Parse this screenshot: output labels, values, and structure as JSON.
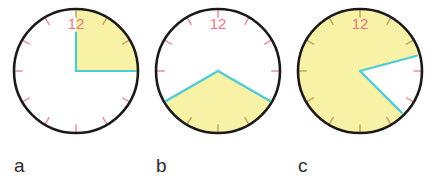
{
  "figure": {
    "title": "",
    "canvas": {
      "width": 435,
      "height": 182,
      "background": "#ffffff"
    },
    "style": {
      "sector_fill": "#f7f2a6",
      "rim_color": "#1a1a1a",
      "rim_width": 2.6,
      "tick_color": "#e98f9c",
      "tick_color_on_yellow": "#c9a06a",
      "hand_color": "#4ec9da",
      "hand_width": 2.2,
      "number_color": "#ef7486",
      "label_color": "#2b2b2b"
    },
    "geometry": {
      "radius": 62,
      "center_y": 71,
      "tick_count": 12,
      "tick_inner_fraction": 0.86
    },
    "clocks": [
      {
        "id": "clock-a",
        "label": "a",
        "label_x": 14,
        "label_y": 172,
        "center_x": 76,
        "hour_number": "12",
        "number_x": 76,
        "number_y": 29,
        "sector_start_deg": 0,
        "sector_sweep_deg": 90,
        "sector_description": "quarter turn clockwise from 12 to 3",
        "hands": [
          {
            "name": "hand-start",
            "angle_deg": 0,
            "length_fraction": 0.62
          },
          {
            "name": "hand-end",
            "angle_deg": 90,
            "length_fraction": 0.95
          }
        ]
      },
      {
        "id": "clock-b",
        "label": "b",
        "label_x": 156,
        "label_y": 172,
        "center_x": 218,
        "hour_number": "12",
        "number_x": 218,
        "number_y": 29,
        "sector_start_deg": 120,
        "sector_sweep_deg": 120,
        "sector_description": "sector across the bottom from 4 to 8 o'clock",
        "hands": [
          {
            "name": "hand-start",
            "angle_deg": 120,
            "length_fraction": 0.97
          },
          {
            "name": "hand-end",
            "angle_deg": 240,
            "length_fraction": 0.97
          }
        ]
      },
      {
        "id": "clock-c",
        "label": "c",
        "label_x": 298,
        "label_y": 172,
        "center_x": 360,
        "hour_number": "12",
        "number_x": 360,
        "number_y": 29,
        "sector_start_deg": 135,
        "sector_sweep_deg": 300,
        "sector_description": "five-sixths turn; white wedge remains between 1:30 and 4:30",
        "hands": [
          {
            "name": "hand-start",
            "angle_deg": 135,
            "length_fraction": 0.95
          },
          {
            "name": "hand-end",
            "angle_deg": 75,
            "length_fraction": 0.95
          }
        ]
      }
    ]
  },
  "chart_data": {
    "type": "pie",
    "xlabel": "",
    "ylabel": "",
    "legend": [],
    "grid": false,
    "unit": "degrees of turn",
    "categories": [
      "a",
      "b",
      "c"
    ],
    "values": [
      90,
      120,
      300
    ],
    "series": [
      {
        "name": "shaded sector (degrees)",
        "values": [
          90,
          120,
          300
        ]
      },
      {
        "name": "shaded sector (fraction of turn)",
        "values": [
          0.25,
          0.3333,
          0.8333
        ]
      }
    ],
    "annotations": [
      {
        "panel": "a",
        "text": "12",
        "note": "shaded quarter turn from 12 to 3 o'clock"
      },
      {
        "panel": "b",
        "text": "12",
        "note": "shaded third of a turn across the bottom, 4 to 8 o'clock"
      },
      {
        "panel": "c",
        "text": "12",
        "note": "shaded five-sixths of a turn, unshaded wedge on the right"
      }
    ]
  }
}
